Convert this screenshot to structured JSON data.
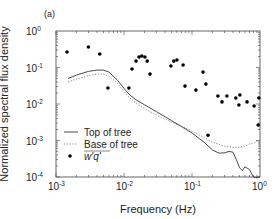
{
  "panel_label": "(a)",
  "chart_data": {
    "type": "line",
    "title": "",
    "xlabel": "Frequency (Hz)",
    "ylabel": "Normalized spectral flux density",
    "xscale": "log",
    "yscale": "log",
    "xlim": [
      0.001,
      1
    ],
    "ylim": [
      0.0001,
      1
    ],
    "grid": false,
    "legend_position": "lower left",
    "x_ticks": [
      {
        "base": "10",
        "exp": "-3",
        "value": 0.001
      },
      {
        "base": "10",
        "exp": "-2",
        "value": 0.01
      },
      {
        "base": "10",
        "exp": "-1",
        "value": 0.1
      },
      {
        "base": "10",
        "exp": "0",
        "value": 1
      }
    ],
    "y_ticks": [
      {
        "base": "10",
        "exp": "0",
        "value": 1
      },
      {
        "base": "10",
        "exp": "-1",
        "value": 0.1
      },
      {
        "base": "10",
        "exp": "-2",
        "value": 0.01
      },
      {
        "base": "10",
        "exp": "-3",
        "value": 0.001
      },
      {
        "base": "10",
        "exp": "-4",
        "value": 0.0001
      }
    ],
    "series": [
      {
        "name": "Top of tree",
        "style": "solid",
        "x": [
          0.0015,
          0.002,
          0.003,
          0.004,
          0.005,
          0.006,
          0.008,
          0.01,
          0.012,
          0.015,
          0.02,
          0.03,
          0.05,
          0.07,
          0.1,
          0.15,
          0.2,
          0.25,
          0.3,
          0.35,
          0.4,
          0.45,
          0.5,
          0.55,
          0.6,
          0.7,
          0.8,
          0.9,
          1.0
        ],
        "values": [
          0.05,
          0.062,
          0.078,
          0.085,
          0.085,
          0.075,
          0.045,
          0.027,
          0.018,
          0.013,
          0.0095,
          0.0062,
          0.0035,
          0.0024,
          0.0016,
          0.0009,
          0.00055,
          0.00045,
          0.00046,
          0.0005,
          0.00048,
          0.0003,
          0.00018,
          0.00015,
          0.00019,
          0.00016,
          0.0001,
          9.5e-05,
          0.0001
        ]
      },
      {
        "name": "Base of tree",
        "style": "dotted",
        "x": [
          0.0015,
          0.002,
          0.003,
          0.004,
          0.005,
          0.006,
          0.008,
          0.01,
          0.012,
          0.015,
          0.02,
          0.03,
          0.05,
          0.07,
          0.1,
          0.15,
          0.2,
          0.3,
          0.4,
          0.5,
          0.6,
          0.7,
          0.8,
          0.9,
          1.0
        ],
        "values": [
          0.04,
          0.048,
          0.06,
          0.066,
          0.066,
          0.058,
          0.037,
          0.022,
          0.015,
          0.0105,
          0.0075,
          0.005,
          0.0032,
          0.0025,
          0.0018,
          0.0012,
          0.0009,
          0.0007,
          0.00065,
          0.00065,
          0.0007,
          0.0008,
          0.00085,
          0.00095,
          0.001
        ]
      },
      {
        "name": "w'q'",
        "style": "markers",
        "x": [
          0.00145,
          0.003,
          0.0044,
          0.0058,
          0.0118,
          0.0131,
          0.015,
          0.0166,
          0.0183,
          0.0203,
          0.0219,
          0.0241,
          0.049,
          0.054,
          0.06,
          0.074,
          0.079,
          0.114,
          0.145,
          0.16,
          0.172,
          0.24,
          0.276,
          0.326,
          0.441,
          0.49,
          0.506,
          0.643,
          0.82,
          0.94,
          0.96
        ],
        "values": [
          0.266,
          0.365,
          0.235,
          0.0275,
          0.0275,
          0.091,
          0.15,
          0.194,
          0.207,
          0.194,
          0.15,
          0.066,
          0.11,
          0.15,
          0.16,
          0.117,
          0.031,
          0.024,
          0.075,
          0.035,
          0.0014,
          0.0166,
          0.0114,
          0.0166,
          0.0146,
          0.0094,
          0.0176,
          0.0114,
          0.0088,
          0.00266,
          0.0146
        ]
      }
    ]
  },
  "legend": {
    "items": [
      {
        "label": "Top of tree",
        "style": "solid"
      },
      {
        "label": "Base of tree",
        "style": "dotted"
      },
      {
        "label": "w'q'",
        "style": "markers"
      }
    ]
  },
  "colors": {
    "line": "#333333",
    "dotted": "#777777",
    "marker": "#000000",
    "frame": "#555555"
  }
}
